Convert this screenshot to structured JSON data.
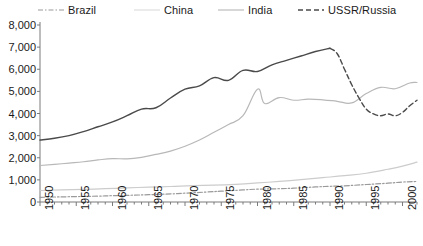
{
  "chart_data": {
    "type": "line",
    "title": "",
    "subtitle": "",
    "xlabel": "",
    "ylabel": "",
    "xlim": [
      1950,
      2002
    ],
    "ylim": [
      0,
      8000
    ],
    "grid": false,
    "legend_position": "top",
    "y_ticks": [
      "0",
      "1,000",
      "2,000",
      "3,000",
      "4,000",
      "5,000",
      "6,000",
      "7,000",
      "8,000"
    ],
    "y_tick_values": [
      0,
      1000,
      2000,
      3000,
      4000,
      5000,
      6000,
      7000,
      8000
    ],
    "x_ticks": [
      "1950",
      "1955",
      "1960",
      "1965",
      "1970",
      "1975",
      "1980",
      "1985",
      "1990",
      "1995",
      "2000"
    ],
    "x_tick_values": [
      1950,
      1955,
      1960,
      1965,
      1970,
      1975,
      1980,
      1985,
      1990,
      1995,
      2000
    ],
    "x_minor_step": 1,
    "series": [
      {
        "name": "Brazil",
        "color": "#9a9a9a",
        "style": "dashdot",
        "x": [
          1950,
          1952,
          1955,
          1958,
          1960,
          1963,
          1965,
          1968,
          1970,
          1973,
          1975,
          1978,
          1980,
          1983,
          1985,
          1988,
          1990,
          1992,
          1995,
          1998,
          2000,
          2002
        ],
        "values": [
          210,
          225,
          245,
          265,
          285,
          310,
          330,
          365,
          400,
          450,
          490,
          545,
          580,
          600,
          625,
          680,
          710,
          730,
          790,
          850,
          900,
          930
        ]
      },
      {
        "name": "China",
        "color": "#b8b8b8",
        "style": "solid",
        "x": [
          1950,
          1952,
          1954,
          1956,
          1958,
          1960,
          1962,
          1964,
          1966,
          1968,
          1970,
          1972,
          1974,
          1976,
          1978,
          1980,
          1981,
          1983,
          1985,
          1987,
          1989,
          1991,
          1993,
          1995,
          1997,
          1999,
          2001,
          2002
        ],
        "values": [
          1650,
          1700,
          1760,
          1820,
          1900,
          1960,
          1950,
          2020,
          2150,
          2300,
          2520,
          2800,
          3150,
          3500,
          3900,
          5100,
          4450,
          4720,
          4600,
          4650,
          4620,
          4550,
          4480,
          4900,
          5180,
          5120,
          5380,
          5400
        ]
      },
      {
        "name": "India",
        "color": "#cccccc",
        "style": "solid",
        "x": [
          1950,
          1953,
          1956,
          1959,
          1962,
          1965,
          1968,
          1971,
          1974,
          1977,
          1980,
          1983,
          1986,
          1989,
          1992,
          1995,
          1998,
          2000,
          2002
        ],
        "values": [
          520,
          545,
          570,
          600,
          640,
          670,
          700,
          740,
          760,
          800,
          860,
          930,
          1010,
          1100,
          1190,
          1300,
          1480,
          1620,
          1800
        ]
      },
      {
        "name": "USSR/Russia",
        "color": "#4a4a4a",
        "style": "solid-then-dashed",
        "dash_from": 1990,
        "x": [
          1950,
          1952,
          1954,
          1956,
          1958,
          1960,
          1962,
          1964,
          1966,
          1968,
          1970,
          1972,
          1974,
          1976,
          1978,
          1980,
          1982,
          1984,
          1986,
          1988,
          1990,
          1991,
          1992,
          1993,
          1994,
          1995,
          1996,
          1997,
          1998,
          1999,
          2000,
          2001,
          2002
        ],
        "values": [
          2800,
          2880,
          3000,
          3180,
          3400,
          3620,
          3900,
          4200,
          4260,
          4700,
          5100,
          5250,
          5620,
          5500,
          5950,
          5900,
          6200,
          6400,
          6600,
          6800,
          6950,
          6700,
          6000,
          5300,
          4700,
          4200,
          3980,
          3900,
          3980,
          3900,
          4050,
          4350,
          4600
        ]
      }
    ]
  },
  "legend": {
    "items": [
      {
        "label": "Brazil"
      },
      {
        "label": "China"
      },
      {
        "label": "India"
      },
      {
        "label": "USSR/Russia"
      }
    ]
  }
}
